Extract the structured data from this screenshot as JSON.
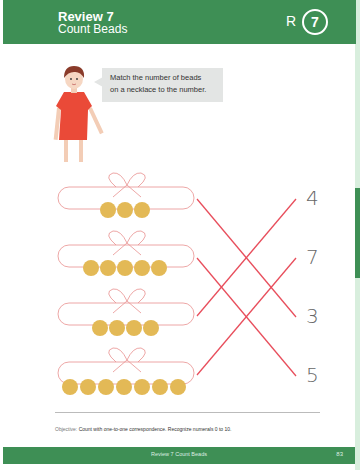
{
  "header": {
    "title": "Review 7",
    "subtitle": "Count Beads",
    "badge_letter": "R",
    "badge_number": "7",
    "color": "#3e8f55"
  },
  "instruction": {
    "character": "girl-in-red-dress",
    "text_line1": "Match the number of beads",
    "text_line2": "on a necklace to the number."
  },
  "necklaces": [
    {
      "beads": 3,
      "matched_to": "3"
    },
    {
      "beads": 5,
      "matched_to": "5"
    },
    {
      "beads": 4,
      "matched_to": "4"
    },
    {
      "beads": 7,
      "matched_to": "7"
    }
  ],
  "numbers": [
    "4",
    "7",
    "3",
    "5"
  ],
  "colors": {
    "bead": "#e3b956",
    "string": "#e8918f",
    "match_line": "#e84e5c"
  },
  "objective": {
    "label": "Objective:",
    "text": "Count with one-to-one correspondence. Recognize numerals 0 to 10."
  },
  "footer": {
    "title": "Review 7  Count Beads",
    "page_number": "83"
  }
}
